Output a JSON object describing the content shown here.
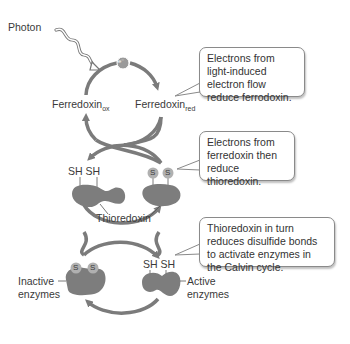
{
  "labels": {
    "photon": "Photon",
    "electron": "e⁻",
    "ferredoxin_ox_base": "Ferredoxin",
    "ferredoxin_ox_sub": "ox",
    "ferredoxin_red_base": "Ferredoxin",
    "ferredoxin_red_sub": "red",
    "thioredoxin": "Thioredoxin",
    "sh_pair_thioredoxin": "SH SH",
    "s_left": "S",
    "s_right": "S",
    "sh_pair_enzyme": "SH SH",
    "inactive_enzymes_line1": "Inactive",
    "inactive_enzymes_line2": "enzymes",
    "active_enzymes_line1": "Active",
    "active_enzymes_line2": "enzymes"
  },
  "callouts": [
    {
      "text": "Electrons from light-induced electron flow reduce ferrodoxin."
    },
    {
      "text": "Electrons from ferredoxin then reduce thioredoxin."
    },
    {
      "text": "Thioredoxin in turn reduces disulfide bonds to activate enzymes in the Calvin cycle."
    }
  ],
  "colors": {
    "arrow": "#7b7b7b",
    "protein": "#7d7d7d",
    "sulfur_bead": "#b0b0b0",
    "callout_border": "#8a8a8a"
  }
}
